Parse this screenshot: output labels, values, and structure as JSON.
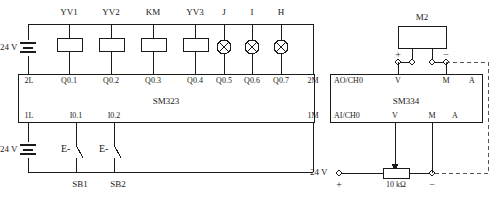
{
  "diagram": {
    "line_color": "#1a1a1a",
    "dashed_color": "#555555"
  },
  "modules": [
    {
      "name": "SM323",
      "label": "SM323"
    },
    {
      "name": "SM334",
      "label": "SM334"
    }
  ],
  "output_section": {
    "supply_label": "24 V",
    "terminals": [
      "2L",
      "Q0.1",
      "Q0.2",
      "Q0.3",
      "Q0.4",
      "Q0.5",
      "Q0.6",
      "Q0.7",
      "2M"
    ],
    "devices": [
      {
        "label": "YV1",
        "symbol": "coil"
      },
      {
        "label": "YV2",
        "symbol": "coil"
      },
      {
        "label": "KM",
        "symbol": "coil"
      },
      {
        "label": "YV3",
        "symbol": "coil"
      },
      {
        "label": "J",
        "symbol": "lamp"
      },
      {
        "label": "I",
        "symbol": "lamp"
      },
      {
        "label": "H",
        "symbol": "lamp"
      }
    ]
  },
  "input_section": {
    "supply_label": "24 V",
    "terminals": [
      "1L",
      "I0.1",
      "I0.2",
      "1M"
    ],
    "switches": [
      {
        "label": "SB1",
        "symbol": "E-\\"
      },
      {
        "label": "SB2",
        "symbol": "E-\\"
      }
    ],
    "contact_mark": "E-"
  },
  "analog_output": {
    "header": "AO/CH0",
    "terminals": [
      "V",
      "M",
      "A"
    ],
    "load": {
      "label": "M2",
      "plus": "+",
      "minus": "−"
    }
  },
  "analog_input": {
    "header": "AI/CH0",
    "terminals": [
      "V",
      "M",
      "A"
    ],
    "source": {
      "supply_label": "24 V",
      "plus": "+",
      "minus": "−",
      "resistor_label": "10 kΩ"
    }
  }
}
